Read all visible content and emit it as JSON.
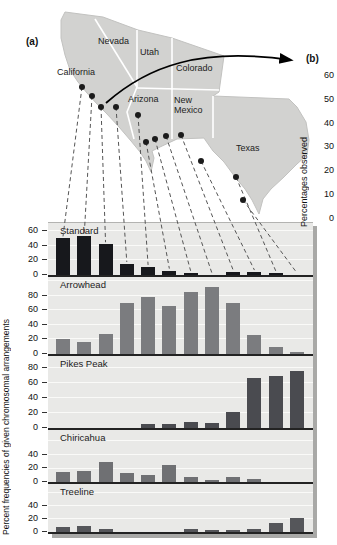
{
  "figure": {
    "panel_a_label": "(a)",
    "panel_b_label": "(b)",
    "left_axis_label": "Percent frequencies of given chromosomal arrangements",
    "right_axis_label": "Percentages observed",
    "right_axis_ticks": [
      "60",
      "50",
      "40",
      "30",
      "20",
      "10",
      "0"
    ]
  },
  "map": {
    "land_color": "#d2d2d0",
    "border_color": "#ffffff",
    "site_dot_color": "#1b1b1b",
    "states": [
      {
        "name": "California",
        "x": 57,
        "y": 67
      },
      {
        "name": "Nevada",
        "x": 98,
        "y": 36
      },
      {
        "name": "Utah",
        "x": 140,
        "y": 47
      },
      {
        "name": "Colorado",
        "x": 176,
        "y": 63
      },
      {
        "name": "Arizona",
        "x": 128,
        "y": 94
      },
      {
        "name": "New Mexico",
        "x": 174,
        "y": 95,
        "w": 46
      },
      {
        "name": "Texas",
        "x": 236,
        "y": 143
      }
    ],
    "sites": [
      {
        "x": 82,
        "y": 87
      },
      {
        "x": 92,
        "y": 96
      },
      {
        "x": 101,
        "y": 107
      },
      {
        "x": 116,
        "y": 107
      },
      {
        "x": 138,
        "y": 115
      },
      {
        "x": 146,
        "y": 142
      },
      {
        "x": 155,
        "y": 139
      },
      {
        "x": 166,
        "y": 136
      },
      {
        "x": 181,
        "y": 135
      },
      {
        "x": 201,
        "y": 161
      },
      {
        "x": 236,
        "y": 177
      },
      {
        "x": 243,
        "y": 200
      }
    ]
  },
  "chart_data": {
    "type": "bar",
    "n_sites": 12,
    "grid": true,
    "panels": [
      {
        "label": "Standard",
        "color": "#17181c",
        "ticks": [
          60,
          40,
          20,
          0
        ],
        "ymax": 71,
        "height_px": 52,
        "values": [
          50,
          53,
          42,
          15,
          11,
          6,
          3,
          0,
          4,
          4,
          3,
          0
        ]
      },
      {
        "label": "Arrowhead",
        "color": "#7b7c7f",
        "ticks": [
          80,
          60,
          40,
          20,
          0
        ],
        "ymax": 106,
        "height_px": 77,
        "values": [
          20,
          17,
          27,
          70,
          78,
          66,
          86,
          92,
          70,
          26,
          10,
          3
        ]
      },
      {
        "label": "Pikes Peak",
        "color": "#4a4b50",
        "ticks": [
          80,
          60,
          40,
          20,
          0
        ],
        "ymax": 96,
        "height_px": 72,
        "values": [
          0,
          0,
          0,
          0,
          5,
          6,
          8,
          7,
          22,
          67,
          70,
          76
        ]
      },
      {
        "label": "Chiricahua",
        "color": "#6f7073",
        "ticks": [
          40,
          20,
          0
        ],
        "ymax": 77,
        "height_px": 52,
        "values": [
          15,
          17,
          30,
          14,
          10,
          25,
          8,
          3,
          7,
          4,
          0,
          0
        ]
      },
      {
        "label": "Treeline",
        "color": "#55565a",
        "ticks": [
          40,
          20,
          0
        ],
        "ymax": 74,
        "height_px": 48,
        "values": [
          7,
          9,
          5,
          0,
          0,
          0,
          4,
          3,
          3,
          5,
          14,
          21
        ]
      }
    ]
  }
}
